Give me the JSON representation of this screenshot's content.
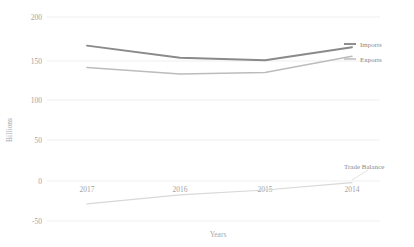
{
  "chart_data": {
    "type": "line",
    "title": "",
    "xlabel": "Years",
    "ylabel": "Billions",
    "categories": [
      "2017",
      "2016",
      "2015",
      "2014"
    ],
    "ylim": [
      -50,
      200
    ],
    "yticks": [
      200,
      150,
      100,
      50,
      0,
      -50
    ],
    "ytick_labels": [
      "200",
      "150",
      "100",
      "50",
      "0",
      "-50"
    ],
    "grid": true,
    "legend_position": "right-inline",
    "series": [
      {
        "name": "Imports",
        "values": [
          165,
          150,
          147,
          163
        ],
        "color": "#8a8a8a"
      },
      {
        "name": "Exports",
        "values": [
          138,
          130,
          132,
          152
        ],
        "color": "#bcbcbc"
      },
      {
        "name": "Trade Balance",
        "values": [
          -29,
          -18,
          -12,
          -3
        ],
        "color": "#d8d8d8"
      }
    ]
  },
  "axes": {
    "y_title": "Billions",
    "x_title": "Years",
    "y_tick_0": "200",
    "y_tick_1": "150",
    "y_tick_2": "100",
    "y_tick_3": "50",
    "y_tick_4": "0",
    "y_tick_5": "-50",
    "x_tick_0": "2017",
    "x_tick_1": "2016",
    "x_tick_2": "2015",
    "x_tick_3": "2014"
  },
  "legend": {
    "imports_label": "Imports",
    "exports_label": "Exports",
    "balance_label": "Trade Balance"
  },
  "colors": {
    "imports": "#8a8a8a",
    "exports": "#bcbcbc",
    "balance": "#d8d8d8",
    "grid": "#e8e8e8",
    "text": "#a3a3a3",
    "background": "#ffffff"
  }
}
